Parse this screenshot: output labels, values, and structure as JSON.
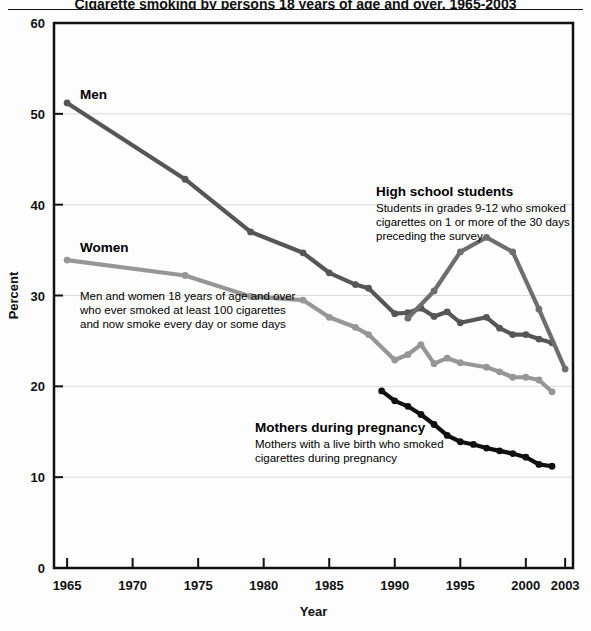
{
  "page": {
    "partial_title": "Cigarette smoking by persons 18 years of age and over, 1965-2003",
    "background_color": "#fdfdfd"
  },
  "chart_data": {
    "type": "line",
    "title": "",
    "xlabel": "Year",
    "ylabel": "Percent",
    "xlim": [
      1964,
      2003.6
    ],
    "ylim": [
      0,
      60
    ],
    "ytick_step": 10,
    "grid": "horizontal-light",
    "xticks": [
      1965,
      1970,
      1975,
      1980,
      1985,
      1990,
      1995,
      2000,
      2003
    ],
    "xtick_labels": [
      "1965",
      "1970",
      "1975",
      "1980",
      "1985",
      "1990",
      "1995",
      "2000",
      "2003"
    ],
    "yticks": [
      0,
      10,
      20,
      30,
      40,
      50,
      60
    ],
    "ytick_labels": [
      "0",
      "10",
      "20",
      "30",
      "40",
      "50",
      "60"
    ],
    "legend": "inline-annotations",
    "series": [
      {
        "name": "Men",
        "color": "#565656",
        "marker": true,
        "x": [
          1965,
          1974,
          1979,
          1983,
          1985,
          1987,
          1988,
          1990,
          1991,
          1992,
          1993,
          1994,
          1995,
          1997,
          1998,
          1999,
          2000,
          2001,
          2002
        ],
        "values": [
          51.2,
          42.8,
          37.0,
          34.7,
          32.5,
          31.2,
          30.8,
          28.0,
          28.1,
          28.6,
          27.7,
          28.2,
          27.0,
          27.6,
          26.4,
          25.7,
          25.7,
          25.2,
          24.8
        ]
      },
      {
        "name": "Women",
        "color": "#969696",
        "marker": true,
        "x": [
          1965,
          1974,
          1979,
          1983,
          1985,
          1987,
          1988,
          1990,
          1991,
          1992,
          1993,
          1994,
          1995,
          1997,
          1998,
          1999,
          2000,
          2001,
          2002
        ],
        "values": [
          33.9,
          32.2,
          29.9,
          29.5,
          27.6,
          26.5,
          25.7,
          22.9,
          23.5,
          24.6,
          22.5,
          23.1,
          22.6,
          22.1,
          21.6,
          21.0,
          21.0,
          20.7,
          19.4
        ]
      },
      {
        "name": "High school students",
        "color": "#6e6e6e",
        "marker": true,
        "x": [
          1991,
          1993,
          1995,
          1997,
          1999,
          2001,
          2003
        ],
        "values": [
          27.5,
          30.5,
          34.8,
          36.4,
          34.8,
          28.5,
          21.9
        ]
      },
      {
        "name": "Mothers during pregnancy",
        "color": "#101010",
        "marker": true,
        "x": [
          1989,
          1990,
          1991,
          1992,
          1993,
          1994,
          1995,
          1996,
          1997,
          1998,
          1999,
          2000,
          2001,
          2002
        ],
        "values": [
          19.5,
          18.4,
          17.8,
          16.9,
          15.8,
          14.6,
          13.9,
          13.6,
          13.2,
          12.9,
          12.6,
          12.2,
          11.4,
          11.2
        ]
      }
    ],
    "annotations": [
      {
        "id": "men",
        "head": "Men",
        "body": "",
        "x": 80,
        "y": 99
      },
      {
        "id": "women",
        "head": "Women",
        "body": "",
        "x": 80,
        "y": 252
      },
      {
        "id": "men-women-note",
        "head": "",
        "body_lines": [
          "Men and women 18 years of age and over",
          "who ever smoked at least 100 cigarettes",
          "and now smoke every day or some days"
        ],
        "x": 80,
        "y": 300
      },
      {
        "id": "high-school-students",
        "head": "High school students",
        "body_lines": [
          "Students in grades 9-12 who smoked",
          "cigarettes on 1 or more of the 30 days",
          "preceding the survey"
        ],
        "x": 376,
        "y": 196
      },
      {
        "id": "mothers-during-pregnancy",
        "head": "Mothers during pregnancy",
        "body_lines": [
          "Mothers with a live birth who smoked",
          "cigarettes during pregnancy"
        ],
        "x": 255,
        "y": 432
      }
    ]
  }
}
